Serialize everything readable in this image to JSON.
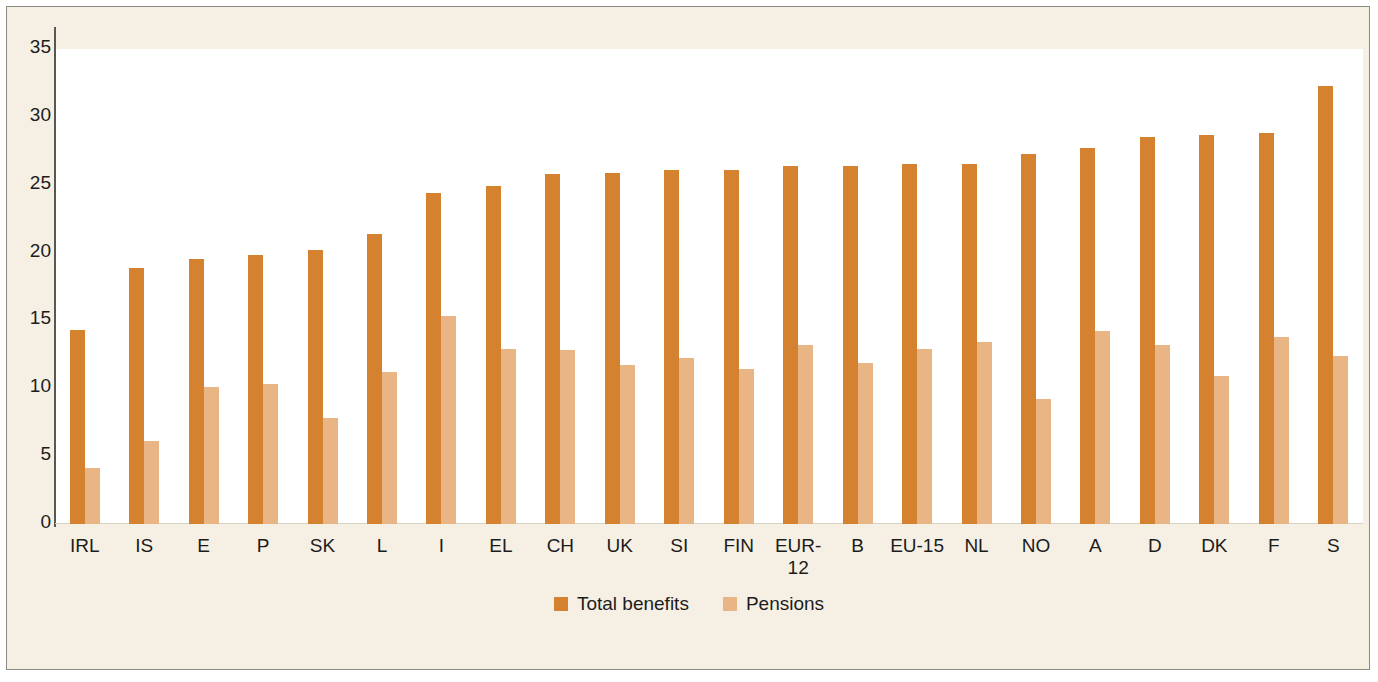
{
  "chart_data": {
    "type": "bar",
    "title": "",
    "subtitle": "",
    "xlabel": "",
    "ylabel": "",
    "ylim": [
      0,
      35
    ],
    "yticks": [
      35,
      30,
      25,
      20,
      15,
      10,
      5,
      0
    ],
    "grid": false,
    "legend_position": "bottom",
    "categories": [
      "IRL",
      "IS",
      "E",
      "P",
      "SK",
      "L",
      "I",
      "EL",
      "CH",
      "UK",
      "SI",
      "FIN",
      "EUR-12",
      "B",
      "EU-15",
      "NL",
      "NO",
      "A",
      "D",
      "DK",
      "F",
      "S"
    ],
    "series": [
      {
        "name": "Total benefits",
        "color": "#d4822f",
        "values": [
          14.3,
          18.9,
          19.5,
          19.8,
          20.2,
          21.4,
          24.4,
          24.9,
          25.8,
          25.9,
          26.1,
          26.1,
          26.4,
          26.4,
          26.5,
          26.5,
          27.3,
          27.7,
          28.5,
          28.7,
          28.8,
          32.3
        ]
      },
      {
        "name": "Pensions",
        "color": "#e9b584",
        "values": [
          4.1,
          6.1,
          10.1,
          10.3,
          7.8,
          11.2,
          15.3,
          12.9,
          12.8,
          11.7,
          12.2,
          11.4,
          13.2,
          11.9,
          12.9,
          13.4,
          9.2,
          14.2,
          13.2,
          10.9,
          13.8,
          12.4
        ]
      }
    ]
  },
  "axis": {
    "y_tick_labels": [
      "35",
      "30",
      "25",
      "20",
      "15",
      "10",
      "5",
      "0"
    ]
  },
  "legend": {
    "items": [
      {
        "label": "Total benefits",
        "swatch": "legend-swatch-total-benefits"
      },
      {
        "label": "Pensions",
        "swatch": "legend-swatch-pensions"
      }
    ]
  },
  "colors": {
    "total_benefits": "#d4822f",
    "pensions": "#e9b584",
    "figure_background": "#f6f0e4",
    "plot_background": "#ffffff",
    "axis": "#5a5751",
    "text": "#1c1c1c"
  }
}
